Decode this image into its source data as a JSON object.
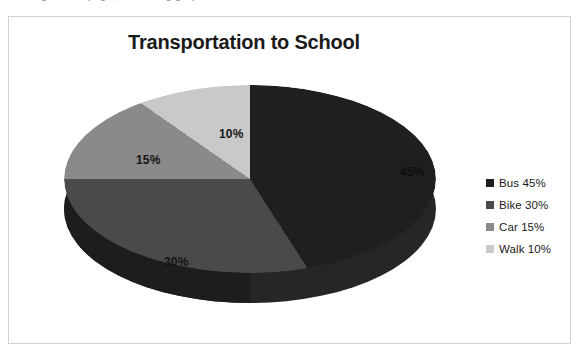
{
  "page": {
    "top_sliver_text": "working on this page, something graph"
  },
  "chart": {
    "title": "Transportation to School",
    "legend": [
      {
        "label": "Bus 45%",
        "color": "#1f1f1f",
        "swatch_name": "legend-swatch-bus"
      },
      {
        "label": "Bike 30%",
        "color": "#4a4a4a",
        "swatch_name": "legend-swatch-bike"
      },
      {
        "label": "Car 15%",
        "color": "#8a8a8a",
        "swatch_name": "legend-swatch-car"
      },
      {
        "label": "Walk 10%",
        "color": "#c9c9c9",
        "swatch_name": "legend-swatch-walk"
      }
    ],
    "labels": {
      "bus": "45%",
      "bike": "30%",
      "car": "15%",
      "walk": "10%"
    }
  },
  "chart_data": {
    "type": "pie",
    "title": "Transportation to School",
    "xlabel": "",
    "ylabel": "",
    "categories": [
      "Bus",
      "Bike",
      "Car",
      "Walk"
    ],
    "values": [
      45,
      30,
      15,
      10
    ],
    "value_unit": "%",
    "data_labels": [
      "45%",
      "30%",
      "15%",
      "10%"
    ],
    "legend_entries": [
      "Bus 45%",
      "Bike 30%",
      "Car 15%",
      "Walk 10%"
    ],
    "colors": [
      "#1f1f1f",
      "#4a4a4a",
      "#8a8a8a",
      "#c9c9c9"
    ],
    "legend_position": "right",
    "grid": false,
    "three_d": true,
    "start_angle_deg": 0,
    "direction": "clockwise",
    "side_wall_color": "#262626"
  }
}
